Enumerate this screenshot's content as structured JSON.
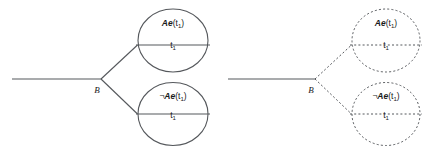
{
  "figure": {
    "background_color": "#ffffff",
    "stroke_color": "#55585c",
    "text_color": "#1a1a1a"
  },
  "diagrams": [
    {
      "id": "solid-branching-diagram",
      "line_style": "solid",
      "branch_point_label": "B",
      "trunk": {
        "x1": 12,
        "y1": 79,
        "x2": 101,
        "y2": 79
      },
      "branch_point": {
        "x": 101,
        "y": 79
      },
      "nodes": [
        {
          "id": "upper-node",
          "position": "upper",
          "formula_negation": "",
          "formula_operator": "Ae",
          "formula_argument": "(t",
          "formula_argument_sub": "1",
          "formula_argument_close": ")",
          "time_label": "t",
          "time_label_sub": "1",
          "circle": {
            "cx": 173,
            "cy": 40.5,
            "rx": 35,
            "ry": 31.5
          },
          "chord": {
            "x1": 136,
            "y1": 45,
            "x2": 210,
            "y2": 45
          }
        },
        {
          "id": "lower-node",
          "position": "lower",
          "formula_negation": "¬",
          "formula_operator": "Ae",
          "formula_argument": "(t",
          "formula_argument_sub": "1",
          "formula_argument_close": ")",
          "time_label": "t",
          "time_label_sub": "1",
          "circle": {
            "cx": 173,
            "cy": 114,
            "rx": 35,
            "ry": 31.5
          },
          "chord": {
            "x1": 136,
            "y1": 114,
            "x2": 210,
            "y2": 114
          }
        }
      ]
    },
    {
      "id": "dashed-branching-diagram",
      "line_style": "dashed",
      "branch_point_label": "B",
      "trunk": {
        "x1": 228,
        "y1": 79,
        "x2": 315,
        "y2": 79
      },
      "branch_point": {
        "x": 315,
        "y": 79
      },
      "nodes": [
        {
          "id": "upper-node",
          "position": "upper",
          "formula_negation": "",
          "formula_operator": "Ae",
          "formula_argument": "(t",
          "formula_argument_sub": "1",
          "formula_argument_close": ")",
          "time_label": "t",
          "time_label_sub": "1",
          "circle": {
            "cx": 386,
            "cy": 40.5,
            "rx": 34,
            "ry": 31.5
          },
          "chord": {
            "x1": 350,
            "y1": 45,
            "x2": 422,
            "y2": 45
          }
        },
        {
          "id": "lower-node",
          "position": "lower",
          "formula_negation": "¬",
          "formula_operator": "Ae",
          "formula_argument": "(t",
          "formula_argument_sub": "1",
          "formula_argument_close": ")",
          "time_label": "t",
          "time_label_sub": "1",
          "circle": {
            "cx": 386,
            "cy": 114,
            "rx": 34,
            "ry": 31.5
          },
          "chord": {
            "x1": 350,
            "y1": 114,
            "x2": 422,
            "y2": 114
          }
        }
      ]
    }
  ],
  "labels": {
    "left_upper_formula": "Ae(t1)",
    "left_lower_formula": "¬Ae(t1)",
    "right_upper_formula": "Ae(t1)",
    "right_lower_formula": "¬Ae(t1)",
    "left_branch_point": "B",
    "right_branch_point": "B",
    "time_point": "t1"
  }
}
